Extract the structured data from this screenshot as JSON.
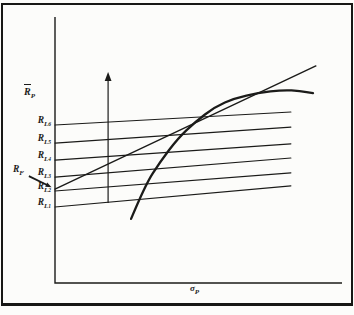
{
  "colors": {
    "ink": "#1b1b19",
    "paper": "#fcfcfa"
  },
  "axes": {
    "y_label": {
      "base": "R",
      "overbar": true,
      "sub": "P"
    },
    "x_label": {
      "base": "σ",
      "sub": "P"
    }
  },
  "rf_label": {
    "base": "R",
    "sub": "F"
  },
  "chart_data": {
    "type": "line",
    "title": "",
    "xlabel": "σ_P (portfolio risk, standard deviation)",
    "ylabel": "R̄_P (expected portfolio return)",
    "x_axis": {
      "range": [
        0,
        100
      ],
      "ticks": [],
      "grid": false
    },
    "y_axis": {
      "range": [
        0,
        100
      ],
      "ticks": [],
      "grid": false
    },
    "legend": "none",
    "series": [
      {
        "name": "lending-line-RL1",
        "label": {
          "base": "R",
          "sub": "L",
          "subsub": "1"
        },
        "smooth": false,
        "width": 1.1,
        "points": [
          [
            0,
            28.6
          ],
          [
            82.2,
            36.5
          ]
        ]
      },
      {
        "name": "lending-line-RL2",
        "label": {
          "base": "R",
          "sub": "L",
          "subsub": "2"
        },
        "smooth": false,
        "width": 1.1,
        "points": [
          [
            0,
            34.6
          ],
          [
            82.2,
            41.4
          ]
        ]
      },
      {
        "name": "lending-line-RL3",
        "label": {
          "base": "R",
          "sub": "L",
          "subsub": "3"
        },
        "smooth": false,
        "width": 1.1,
        "points": [
          [
            0,
            39.8
          ],
          [
            82.2,
            47.0
          ]
        ]
      },
      {
        "name": "lending-line-RL4",
        "label": {
          "base": "R",
          "sub": "L",
          "subsub": "4"
        },
        "smooth": false,
        "width": 1.1,
        "points": [
          [
            0,
            46.2
          ],
          [
            82.2,
            52.3
          ]
        ]
      },
      {
        "name": "lending-line-RL5",
        "label": {
          "base": "R",
          "sub": "L",
          "subsub": "5"
        },
        "smooth": false,
        "width": 1.1,
        "points": [
          [
            0,
            52.6
          ],
          [
            82.2,
            58.6
          ]
        ]
      },
      {
        "name": "lending-line-RL6",
        "label": {
          "base": "R",
          "sub": "L",
          "subsub": "6"
        },
        "smooth": false,
        "width": 1.1,
        "points": [
          [
            0,
            59.4
          ],
          [
            82.2,
            64.3
          ]
        ]
      },
      {
        "name": "capital-market-line",
        "smooth": false,
        "width": 1.4,
        "points": [
          [
            0,
            35.3
          ],
          [
            90.9,
            81.6
          ]
        ]
      },
      {
        "name": "efficient-frontier",
        "smooth": true,
        "width": 2.3,
        "points": [
          [
            26.5,
            24.1
          ],
          [
            31.4,
            36.8
          ],
          [
            36.6,
            45.5
          ],
          [
            42.9,
            54.5
          ],
          [
            48.8,
            60.5
          ],
          [
            55.7,
            66.2
          ],
          [
            62.7,
            69.5
          ],
          [
            70.7,
            71.4
          ],
          [
            79.4,
            72.6
          ],
          [
            85.4,
            72.2
          ],
          [
            89.9,
            71.4
          ]
        ]
      }
    ],
    "annotations": [
      {
        "name": "vertical-shift-arrow",
        "type": "arrow",
        "from": [
          18.5,
          30.1
        ],
        "to": [
          18.5,
          79.3
        ],
        "width": 1.2,
        "head": 9
      },
      {
        "name": "rf-pointer-arrow",
        "type": "arrow",
        "from": [
          -9.1,
          40.2
        ],
        "to": [
          -1.2,
          36.0
        ],
        "width": 1.8,
        "head": 6
      }
    ]
  }
}
